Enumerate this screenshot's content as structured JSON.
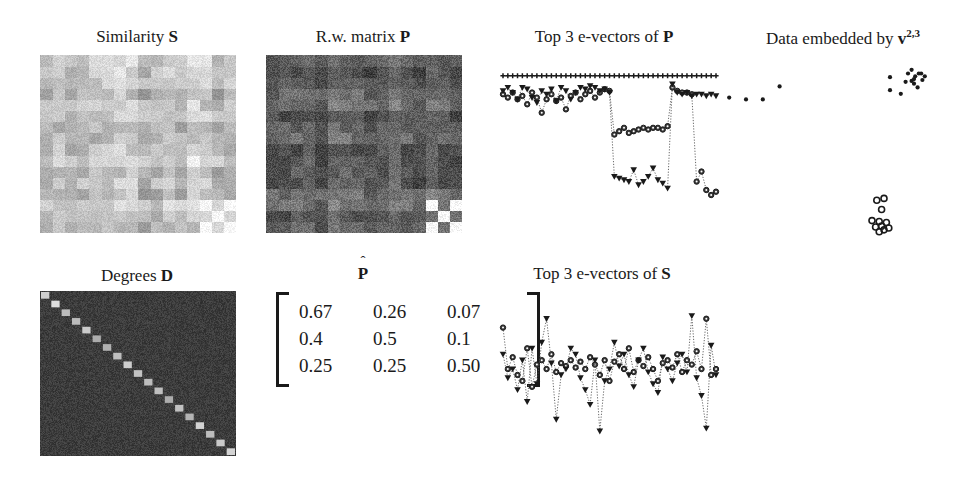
{
  "figure": {
    "width": 967,
    "height": 481,
    "background": "#ffffff",
    "ink": "#1a1a1a"
  },
  "panels": {
    "similarity": {
      "title_prefix": "Similarity ",
      "title_symbol": "S",
      "title_x": 137,
      "title_y": 28,
      "x": 40,
      "y": 55,
      "width": 196,
      "height": 178,
      "kind": "heatmap",
      "blocks": 16,
      "base_gray": 196,
      "block_spread": 34,
      "noise": 16,
      "bright_corner": true,
      "bright_corner_gray": 248
    },
    "rwmatrix": {
      "title_prefix": "R.w. matrix ",
      "title_symbol": "P",
      "title_x": 363,
      "title_y": 28,
      "x": 266,
      "y": 55,
      "width": 196,
      "height": 178,
      "kind": "heatmap",
      "blocks": 16,
      "base_gray": 96,
      "block_spread": 30,
      "noise": 26,
      "bright_corner": true,
      "bright_corner_gray": 252
    },
    "degrees": {
      "title_prefix": "Degrees ",
      "title_symbol": "D",
      "title_x": 137,
      "title_y": 267,
      "x": 40,
      "y": 291,
      "width": 196,
      "height": 165,
      "kind": "diagonal",
      "blocks": 19,
      "base_gray": 60,
      "noise": 16,
      "diag_gray": 225
    },
    "phat": {
      "title_symbol": "P",
      "title_hat": "ˆ",
      "title_x": 363,
      "title_y": 265,
      "x": 276,
      "y": 290,
      "kind": "matrix",
      "rows": [
        [
          "0.67",
          "0.26",
          "0.07"
        ],
        [
          "0.4",
          "0.5",
          "0.1"
        ],
        [
          "0.25",
          "0.25",
          "0.50"
        ]
      ]
    },
    "evec_p": {
      "title_prefix": "Top 3 e-vectors of ",
      "title_symbol": "P",
      "title_x": 604,
      "title_y": 28,
      "x": 497,
      "y": 58,
      "width": 225,
      "height": 180,
      "kind": "lineplot"
    },
    "embedding": {
      "title_prefix": "Data embedded by ",
      "title_symbol": "v",
      "title_sup": "2,3",
      "title_x": 843,
      "title_y": 28,
      "x": 722,
      "y": 55,
      "width": 240,
      "height": 185,
      "kind": "scatter"
    },
    "evec_s": {
      "title_prefix": "Top 3 e-vectors of ",
      "title_symbol": "S",
      "title_x": 602,
      "title_y": 265,
      "x": 497,
      "y": 292,
      "width": 225,
      "height": 160,
      "kind": "lineplot"
    }
  },
  "chart_data": [
    {
      "id": "evec_p",
      "type": "line",
      "title": "Top 3 e-vectors of P",
      "xlabel": "",
      "ylabel": "",
      "grid": false,
      "legend": "none",
      "markers": [
        "plus",
        "circle",
        "triangle-down"
      ],
      "n_points": 45,
      "ylim": [
        0,
        1
      ],
      "note": "First e-vector constant; 2nd and 3rd show piecewise-constant cluster structure",
      "series": [
        {
          "name": "v1",
          "marker": "plus",
          "values": [
            0.93,
            0.93,
            0.93,
            0.93,
            0.93,
            0.93,
            0.93,
            0.93,
            0.93,
            0.93,
            0.93,
            0.93,
            0.93,
            0.93,
            0.93,
            0.93,
            0.93,
            0.93,
            0.93,
            0.93,
            0.93,
            0.93,
            0.93,
            0.93,
            0.93,
            0.93,
            0.93,
            0.93,
            0.93,
            0.93,
            0.93,
            0.93,
            0.93,
            0.93,
            0.93,
            0.93,
            0.93,
            0.93,
            0.93,
            0.93,
            0.93,
            0.93,
            0.93,
            0.93,
            0.93
          ]
        },
        {
          "name": "v2",
          "marker": "circle",
          "values": [
            0.82,
            0.8,
            0.83,
            0.79,
            0.81,
            0.76,
            0.83,
            0.8,
            0.71,
            0.79,
            0.82,
            0.78,
            0.8,
            0.73,
            0.81,
            0.83,
            0.79,
            0.82,
            0.84,
            0.8,
            0.83,
            0.85,
            0.84,
            0.58,
            0.6,
            0.62,
            0.59,
            0.6,
            0.61,
            0.62,
            0.61,
            0.62,
            0.62,
            0.61,
            0.63,
            0.86,
            0.84,
            0.83,
            0.83,
            0.82,
            0.3,
            0.36,
            0.25,
            0.22,
            0.24
          ]
        },
        {
          "name": "v3",
          "marker": "triangle-down",
          "values": [
            0.84,
            0.86,
            0.83,
            0.79,
            0.86,
            0.85,
            0.8,
            0.77,
            0.84,
            0.82,
            0.85,
            0.78,
            0.86,
            0.84,
            0.79,
            0.83,
            0.86,
            0.85,
            0.87,
            0.86,
            0.84,
            0.85,
            0.83,
            0.33,
            0.32,
            0.31,
            0.3,
            0.37,
            0.28,
            0.3,
            0.33,
            0.38,
            0.31,
            0.29,
            0.26,
            0.88,
            0.83,
            0.82,
            0.83,
            0.81,
            0.82,
            0.82,
            0.81,
            0.82,
            0.81
          ]
        }
      ]
    },
    {
      "id": "evec_s",
      "type": "line",
      "title": "Top 3 e-vectors of S",
      "xlabel": "",
      "ylabel": "",
      "grid": false,
      "legend": "none",
      "markers": [
        "circle",
        "triangle-down"
      ],
      "n_points": 45,
      "ylim": [
        0,
        1
      ],
      "note": "Unnormalized similarity e-vectors are noisy with no visible cluster structure",
      "series": [
        {
          "name": "v1",
          "marker": "circle",
          "values": [
            0.8,
            0.52,
            0.6,
            0.48,
            0.44,
            0.66,
            0.4,
            0.55,
            0.58,
            0.52,
            0.62,
            0.5,
            0.56,
            0.54,
            0.58,
            0.53,
            0.57,
            0.52,
            0.6,
            0.55,
            0.48,
            0.58,
            0.44,
            0.57,
            0.62,
            0.52,
            0.66,
            0.5,
            0.58,
            0.54,
            0.6,
            0.52,
            0.44,
            0.56,
            0.58,
            0.53,
            0.62,
            0.5,
            0.58,
            0.55,
            0.64,
            0.52,
            0.86,
            0.48,
            0.52
          ]
        },
        {
          "name": "v2",
          "marker": "triangle-down",
          "values": [
            0.62,
            0.46,
            0.52,
            0.38,
            0.58,
            0.3,
            0.66,
            0.42,
            0.7,
            0.86,
            0.56,
            0.18,
            0.48,
            0.52,
            0.66,
            0.62,
            0.46,
            0.38,
            0.28,
            0.58,
            0.1,
            0.44,
            0.52,
            0.7,
            0.54,
            0.62,
            0.48,
            0.4,
            0.58,
            0.66,
            0.5,
            0.42,
            0.36,
            0.6,
            0.52,
            0.44,
            0.56,
            0.62,
            0.5,
            0.88,
            0.46,
            0.34,
            0.12,
            0.68,
            0.48
          ]
        }
      ]
    },
    {
      "id": "embedding",
      "type": "scatter",
      "title": "Data embedded by v2,3",
      "xlabel": "",
      "ylabel": "",
      "grid": false,
      "legend": "none",
      "clusters": [
        {
          "name": "cluster-a-sparse-dots",
          "marker": "dot",
          "points": [
            [
              0.03,
              0.77
            ],
            [
              0.1,
              0.76
            ],
            [
              0.17,
              0.76
            ],
            [
              0.24,
              0.83
            ]
          ]
        },
        {
          "name": "cluster-b-dense-top-right",
          "marker": "dot",
          "points": [
            [
              0.7,
              0.88
            ],
            [
              0.7,
              0.81
            ],
            [
              0.745,
              0.79
            ],
            [
              0.775,
              0.9
            ],
            [
              0.79,
              0.86
            ],
            [
              0.805,
              0.885
            ],
            [
              0.82,
              0.9
            ],
            [
              0.8,
              0.845
            ],
            [
              0.815,
              0.825
            ],
            [
              0.835,
              0.865
            ],
            [
              0.845,
              0.885
            ],
            [
              0.79,
              0.92
            ],
            [
              0.765,
              0.855
            ],
            [
              0.83,
              0.9
            ],
            [
              0.8,
              0.87
            ]
          ]
        },
        {
          "name": "cluster-c-open-circles-lower",
          "marker": "circle-open",
          "points": [
            [
              0.645,
              0.215
            ],
            [
              0.675,
              0.225
            ],
            [
              0.665,
              0.165
            ],
            [
              0.625,
              0.105
            ],
            [
              0.655,
              0.1
            ],
            [
              0.665,
              0.075
            ],
            [
              0.685,
              0.095
            ],
            [
              0.675,
              0.055
            ],
            [
              0.655,
              0.045
            ],
            [
              0.695,
              0.065
            ],
            [
              0.64,
              0.07
            ]
          ]
        }
      ]
    }
  ]
}
